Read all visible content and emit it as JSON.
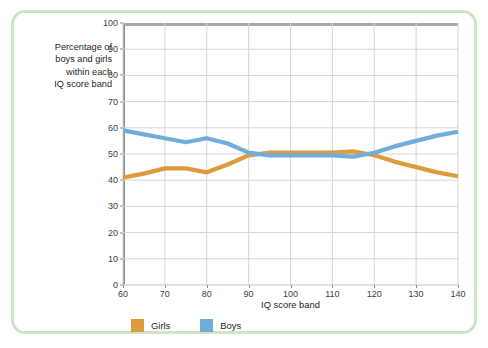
{
  "caption": {
    "lines": [
      "Percentage of",
      "boys and girls",
      "within each",
      "IQ score band"
    ]
  },
  "colors": {
    "girls": "#DD9B3C",
    "boys": "#6FADDB",
    "card_border": "#cfe6c4",
    "grid": "#d6d6d6",
    "axis": "#8d8d8d",
    "plot_top_rule": "#a9a9a9"
  },
  "chart_data": {
    "type": "line",
    "title": "",
    "xlabel": "IQ score band",
    "ylabel": "",
    "xlim": [
      60,
      140
    ],
    "ylim": [
      0,
      100
    ],
    "xticks": [
      60,
      70,
      80,
      90,
      100,
      110,
      120,
      130,
      140
    ],
    "yticks": [
      0,
      10,
      20,
      30,
      40,
      50,
      60,
      70,
      80,
      90,
      100
    ],
    "grid": true,
    "legend_position": "bottom-left",
    "x": [
      60,
      65,
      70,
      75,
      80,
      85,
      90,
      95,
      100,
      105,
      110,
      115,
      120,
      125,
      130,
      135,
      140
    ],
    "series": [
      {
        "name": "Girls",
        "color": "#DD9B3C",
        "values": [
          41,
          42.5,
          44.5,
          44.5,
          43,
          46,
          49.5,
          50.5,
          50.5,
          50.5,
          50.5,
          51,
          49.5,
          47,
          45,
          43,
          41.5
        ]
      },
      {
        "name": "Boys",
        "color": "#6FADDB",
        "values": [
          59,
          57.5,
          56,
          54.5,
          56,
          54,
          50.5,
          49.5,
          49.5,
          49.5,
          49.5,
          49,
          50.5,
          53,
          55,
          57,
          58.5
        ]
      }
    ]
  },
  "legend": {
    "items": [
      {
        "label": "Girls",
        "color": "#DD9B3C"
      },
      {
        "label": "Boys",
        "color": "#6FADDB"
      }
    ]
  }
}
